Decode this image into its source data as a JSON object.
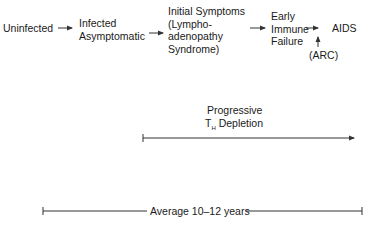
{
  "stages": [
    {
      "label": "Uninfected"
    },
    {
      "lines": [
        "Infected",
        "Asymptomatic"
      ]
    },
    {
      "lines": [
        "Initial Symptoms",
        "(Lympho-",
        "adenopathy",
        "Syndrome)"
      ]
    },
    {
      "lines": [
        "Early",
        "Immune",
        "Failure"
      ]
    },
    {
      "label": "AIDS"
    }
  ],
  "arc_label": "(ARC)",
  "depletion": {
    "line1": "Progressive",
    "t_main": "T",
    "t_sub": "H",
    "line2_rest": " Depletion"
  },
  "duration": {
    "label": "Average 10–12 years"
  },
  "colors": {
    "line": "#333333",
    "text": "#1a1a1a"
  }
}
